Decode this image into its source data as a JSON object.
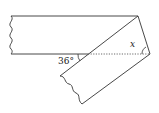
{
  "diagram": {
    "type": "folded-paper-strip",
    "labels": {
      "angle_given": "36°",
      "angle_unknown": "x"
    },
    "colors": {
      "stroke": "#333333",
      "background": "#ffffff"
    }
  }
}
